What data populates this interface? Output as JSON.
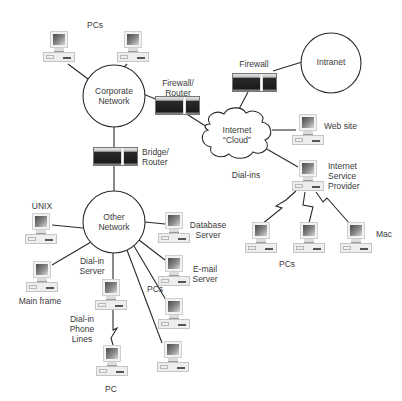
{
  "diagram": {
    "networks": {
      "corporate": {
        "line1": "Corporate",
        "line2": "Network"
      },
      "other": {
        "line1": "Other",
        "line2": "Network"
      },
      "intranet": {
        "label": "Intranet"
      },
      "internet": {
        "line1": "Internet",
        "line2": "“Cloud”"
      }
    },
    "devices": {
      "firewall_router": {
        "line1": "Firewall/",
        "line2": "Router"
      },
      "firewall": {
        "label": "Firewall"
      },
      "bridge_router": {
        "line1": "Bridge/",
        "line2": "Router"
      }
    },
    "labels": {
      "corporate_pcs": "PCs",
      "web_site": "Web site",
      "isp": {
        "line1": "Internet",
        "line2": "Service",
        "line3": "Provider"
      },
      "dial_ins": "Dial-ins",
      "isp_pcs": "PCs",
      "mac": "Mac",
      "unix": "UNIX",
      "main_frame": "Main frame",
      "dial_in_server": {
        "line1": "Dial-in",
        "line2": "Server"
      },
      "dial_in_phone_lines": {
        "line1": "Dial-in",
        "line2": "Phone",
        "line3": "Lines"
      },
      "pc": "PC",
      "database_server": {
        "line1": "Database",
        "line2": "Server"
      },
      "email_server": {
        "line1": "E-mail",
        "line2": "Server"
      },
      "other_pcs": "PCs"
    },
    "colors": {
      "line": "#2a2a2a",
      "background": "#ffffff",
      "text": "#3a3a3a"
    }
  }
}
